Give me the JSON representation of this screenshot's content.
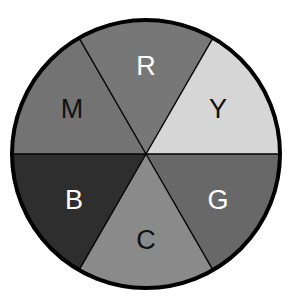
{
  "diagram": {
    "title": "",
    "type": "color-wheel",
    "center": {
      "x": 146,
      "y": 154
    },
    "radius": 134,
    "border_color": "#000000",
    "divider_color": "#000000",
    "sectors": [
      {
        "label": "R",
        "fill": "#777777",
        "text_color": "#ffffff",
        "start_deg": 240,
        "end_deg": 300,
        "label_x": 146,
        "label_y": 66
      },
      {
        "label": "Y",
        "fill": "#d6d6d6",
        "text_color": "#111111",
        "start_deg": 300,
        "end_deg": 360,
        "label_x": 218,
        "label_y": 109
      },
      {
        "label": "G",
        "fill": "#686868",
        "text_color": "#ffffff",
        "start_deg": 0,
        "end_deg": 60,
        "label_x": 218,
        "label_y": 200
      },
      {
        "label": "C",
        "fill": "#8a8a8a",
        "text_color": "#111111",
        "start_deg": 60,
        "end_deg": 120,
        "label_x": 146,
        "label_y": 240
      },
      {
        "label": "B",
        "fill": "#2e2e2e",
        "text_color": "#ffffff",
        "start_deg": 120,
        "end_deg": 180,
        "label_x": 74,
        "label_y": 200
      },
      {
        "label": "M",
        "fill": "#737373",
        "text_color": "#111111",
        "start_deg": 180,
        "end_deg": 240,
        "label_x": 72,
        "label_y": 109
      }
    ]
  }
}
